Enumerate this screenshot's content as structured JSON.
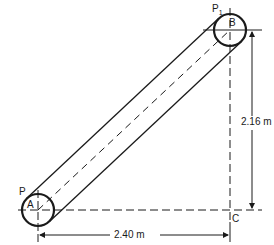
{
  "diagram": {
    "title": "",
    "points": {
      "A": "A",
      "B": "B",
      "C": "C",
      "P": "P",
      "P1_base": "P",
      "P1_sub": "1"
    },
    "dimensions": {
      "horizontal": "2.40 m",
      "vertical": "2.16 m"
    },
    "colors": {
      "line": "#1a1a1a",
      "background": "#ffffff"
    }
  }
}
